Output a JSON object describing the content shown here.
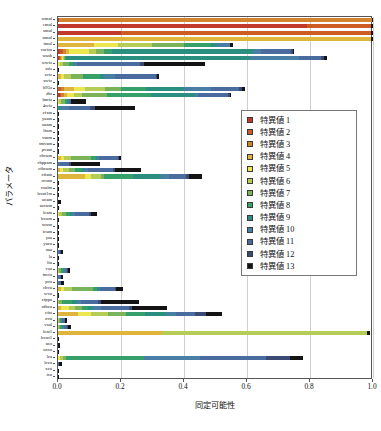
{
  "chart_data": {
    "type": "bar",
    "orientation": "horizontal",
    "stacked": true,
    "title": "",
    "xlabel": "同定可能性",
    "ylabel": "パラメータ",
    "xlim": [
      0.0,
      1.0
    ],
    "xticks": [
      "0.0",
      "0.2",
      "0.4",
      "0.6",
      "0.8",
      "1.0"
    ],
    "xtickvalues": [
      0.0,
      0.2,
      0.4,
      0.6,
      0.8,
      1.0
    ],
    "grid": "vertical",
    "legend_position": "center-right",
    "legend_title": "",
    "colors": [
      "#c0392b",
      "#cd5c23",
      "#d2842e",
      "#dfb53b",
      "#ece74f",
      "#b5cc55",
      "#7ab35a",
      "#35a06a",
      "#2a8f7f",
      "#4a7fa5",
      "#4a6b9e",
      "#3c4a73",
      "#141414"
    ],
    "series": [
      {
        "name": "特異値 1",
        "color": "#c0392b"
      },
      {
        "name": "特異値 2",
        "color": "#cd5c23"
      },
      {
        "name": "特異値 3",
        "color": "#d2842e"
      },
      {
        "name": "特異値 4",
        "color": "#dfb53b"
      },
      {
        "name": "特異値 5",
        "color": "#ece74f"
      },
      {
        "name": "特異値 6",
        "color": "#b5cc55"
      },
      {
        "name": "特異値 7",
        "color": "#7ab35a"
      },
      {
        "name": "特異値 8",
        "color": "#35a06a"
      },
      {
        "name": "特異値 9",
        "color": "#2a8f7f"
      },
      {
        "name": "特異値 10",
        "color": "#4a7fa5"
      },
      {
        "name": "特異値 11",
        "color": "#4a6b9e"
      },
      {
        "name": "特異値 12",
        "color": "#3c4a73"
      },
      {
        "name": "特異値 13",
        "color": "#141414"
      }
    ],
    "categories": [
      "wmul",
      "emul",
      "smul",
      "nmul",
      "imul",
      "variso",
      "wash",
      "wwfz",
      "stfz",
      "scfz",
      "swfz",
      "h95z",
      "dfz",
      "bmfz",
      "4wfz",
      "cfzm",
      "yaam",
      "oaam",
      "lfum",
      "vsum",
      "tmvam",
      "pvam",
      "chvum",
      "cbppam",
      "cfbcum",
      "cftam",
      "ovum",
      "vsulm",
      "lccut1m",
      "ucam",
      "uccum",
      "lcam",
      "lccum",
      "xcum",
      "icum",
      "yaa",
      "yacu",
      "oaa",
      "la",
      "lfu",
      "vsu",
      "tmva",
      "pva",
      "chvu",
      "wvu",
      "cfppa",
      "ofbcu",
      "cfta",
      "ovu",
      "vsul",
      "lcat1",
      "lccut1",
      "uca",
      "uccu",
      "lca",
      "lccu",
      "xcu",
      "icu"
    ],
    "rows": [
      {
        "label": "wmul",
        "segments": [
          0.002,
          0.0,
          0.996,
          0.0,
          0.0,
          0.0,
          0.0,
          0.0,
          0.0,
          0.0,
          0.0,
          0.0,
          0.002
        ]
      },
      {
        "label": "emul",
        "segments": [
          0.79,
          0.205,
          0.0,
          0.0,
          0.0,
          0.0,
          0.0,
          0.0,
          0.0,
          0.0,
          0.0,
          0.0,
          0.005
        ]
      },
      {
        "label": "smul",
        "segments": [
          0.2,
          0.795,
          0.0,
          0.0,
          0.0,
          0.0,
          0.0,
          0.0,
          0.0,
          0.0,
          0.0,
          0.0,
          0.005
        ]
      },
      {
        "label": "nmul",
        "segments": [
          0.0,
          0.0,
          0.0,
          0.995,
          0.0,
          0.0,
          0.0,
          0.0,
          0.0,
          0.0,
          0.0,
          0.0,
          0.005
        ]
      },
      {
        "label": "imul",
        "segments": [
          0.0,
          0.0,
          0.0,
          0.115,
          0.075,
          0.11,
          0.1,
          0.085,
          0.02,
          0.04,
          0.0,
          0.0,
          0.01
        ]
      },
      {
        "label": "variso",
        "segments": [
          0.005,
          0.01,
          0.01,
          0.01,
          0.065,
          0.02,
          0.025,
          0.025,
          0.45,
          0.025,
          0.095,
          0.005,
          0.005
        ]
      },
      {
        "label": "wash",
        "segments": [
          0.003,
          0.003,
          0.003,
          0.003,
          0.003,
          0.003,
          0.003,
          0.003,
          0.585,
          0.155,
          0.07,
          0.01,
          0.01
        ]
      },
      {
        "label": "wwfz",
        "segments": [
          0.0,
          0.0,
          0.0,
          0.0,
          0.005,
          0.01,
          0.02,
          0.012,
          0.005,
          0.01,
          0.2,
          0.01,
          0.195
        ]
      },
      {
        "label": "stfz",
        "segments": [
          0.0,
          0.0,
          0.0,
          0.0,
          0.0,
          0.0,
          0.0,
          0.0,
          0.0,
          0.0,
          0.0,
          0.0,
          0.004
        ]
      },
      {
        "label": "scfz",
        "segments": [
          0.0,
          0.0,
          0.0,
          0.01,
          0.01,
          0.02,
          0.04,
          0.055,
          0.01,
          0.035,
          0.13,
          0.005,
          0.005
        ]
      },
      {
        "label": "swfz",
        "segments": [
          0.0,
          0.0,
          0.0,
          0.0,
          0.0,
          0.0,
          0.0,
          0.0,
          0.0,
          0.0,
          0.0,
          0.0,
          0.004
        ]
      },
      {
        "label": "h95z",
        "segments": [
          0.0,
          0.01,
          0.01,
          0.03,
          0.035,
          0.065,
          0.05,
          0.08,
          0.12,
          0.085,
          0.09,
          0.01,
          0.01
        ]
      },
      {
        "label": "dfz",
        "segments": [
          0.005,
          0.005,
          0.01,
          0.01,
          0.02,
          0.025,
          0.08,
          0.14,
          0.14,
          0.01,
          0.095,
          0.005,
          0.005
        ]
      },
      {
        "label": "bmfz",
        "segments": [
          0.0,
          0.0,
          0.0,
          0.0,
          0.003,
          0.008,
          0.01,
          0.008,
          0.003,
          0.003,
          0.005,
          0.003,
          0.045
        ]
      },
      {
        "label": "4wfz",
        "segments": [
          0.0,
          0.0,
          0.0,
          0.0,
          0.0,
          0.0,
          0.0,
          0.003,
          0.003,
          0.03,
          0.065,
          0.015,
          0.13
        ]
      },
      {
        "label": "cfzm",
        "segments": [
          0.0,
          0.0,
          0.0,
          0.0,
          0.0,
          0.0,
          0.0,
          0.0,
          0.0,
          0.0,
          0.0,
          0.0,
          0.004
        ]
      },
      {
        "label": "yaam",
        "segments": [
          0.0,
          0.0,
          0.0,
          0.0,
          0.0,
          0.0,
          0.0,
          0.0,
          0.0,
          0.0,
          0.0,
          0.0,
          0.004
        ]
      },
      {
        "label": "oaam",
        "segments": [
          0.0,
          0.0,
          0.0,
          0.0,
          0.0,
          0.0,
          0.0,
          0.0,
          0.0,
          0.0,
          0.0,
          0.0,
          0.004
        ]
      },
      {
        "label": "lfum",
        "segments": [
          0.0,
          0.0,
          0.0,
          0.0,
          0.0,
          0.0,
          0.0,
          0.0,
          0.0,
          0.0,
          0.0,
          0.0,
          0.004
        ]
      },
      {
        "label": "vsum",
        "segments": [
          0.0,
          0.0,
          0.0,
          0.0,
          0.0,
          0.0,
          0.0,
          0.0,
          0.0,
          0.0,
          0.0,
          0.0,
          0.004
        ]
      },
      {
        "label": "tmvam",
        "segments": [
          0.0,
          0.0,
          0.0,
          0.0,
          0.0,
          0.0,
          0.0,
          0.0,
          0.0,
          0.0,
          0.0,
          0.0,
          0.004
        ]
      },
      {
        "label": "pvam",
        "segments": [
          0.0,
          0.0,
          0.0,
          0.0,
          0.0,
          0.0,
          0.0,
          0.0,
          0.0,
          0.0,
          0.0,
          0.0,
          0.004
        ]
      },
      {
        "label": "chvum",
        "segments": [
          0.0,
          0.0,
          0.0,
          0.008,
          0.012,
          0.02,
          0.065,
          0.015,
          0.005,
          0.005,
          0.06,
          0.005,
          0.005
        ]
      },
      {
        "label": "cbppam",
        "segments": [
          0.0,
          0.0,
          0.0,
          0.0,
          0.0,
          0.0,
          0.0,
          0.0,
          0.0,
          0.005,
          0.03,
          0.005,
          0.095
        ]
      },
      {
        "label": "cfbcum",
        "segments": [
          0.0,
          0.0,
          0.0,
          0.005,
          0.01,
          0.02,
          0.02,
          0.02,
          0.008,
          0.012,
          0.08,
          0.005,
          0.085
        ]
      },
      {
        "label": "cftam",
        "segments": [
          0.0,
          0.0,
          0.0,
          0.085,
          0.02,
          0.03,
          0.012,
          0.09,
          0.09,
          0.025,
          0.055,
          0.01,
          0.04
        ]
      },
      {
        "label": "ovum",
        "segments": [
          0.0,
          0.0,
          0.0,
          0.0,
          0.0,
          0.0,
          0.0,
          0.0,
          0.0,
          0.0,
          0.0,
          0.0,
          0.004
        ]
      },
      {
        "label": "vsulm",
        "segments": [
          0.0,
          0.0,
          0.0,
          0.0,
          0.0,
          0.0,
          0.0,
          0.0,
          0.0,
          0.0,
          0.0,
          0.0,
          0.004
        ]
      },
      {
        "label": "lccut1m",
        "segments": [
          0.0,
          0.0,
          0.0,
          0.0,
          0.0,
          0.0,
          0.0,
          0.0,
          0.0,
          0.0,
          0.0,
          0.0,
          0.004
        ]
      },
      {
        "label": "ucam",
        "segments": [
          0.0,
          0.0,
          0.0,
          0.0,
          0.0,
          0.0,
          0.0,
          0.0,
          0.0,
          0.0,
          0.0,
          0.0,
          0.008
        ]
      },
      {
        "label": "uccum",
        "segments": [
          0.0,
          0.0,
          0.0,
          0.0,
          0.0,
          0.0,
          0.0,
          0.0,
          0.0,
          0.0,
          0.0,
          0.0,
          0.004
        ]
      },
      {
        "label": "lcam",
        "segments": [
          0.0,
          0.0,
          0.0,
          0.0,
          0.003,
          0.01,
          0.012,
          0.012,
          0.008,
          0.01,
          0.045,
          0.005,
          0.02
        ]
      },
      {
        "label": "lccum",
        "segments": [
          0.0,
          0.0,
          0.0,
          0.0,
          0.0,
          0.0,
          0.0,
          0.0,
          0.0,
          0.0,
          0.0,
          0.0,
          0.004
        ]
      },
      {
        "label": "xcum",
        "segments": [
          0.0,
          0.0,
          0.0,
          0.0,
          0.0,
          0.0,
          0.0,
          0.0,
          0.0,
          0.0,
          0.0,
          0.0,
          0.004
        ]
      },
      {
        "label": "icum",
        "segments": [
          0.0,
          0.0,
          0.0,
          0.0,
          0.0,
          0.0,
          0.0,
          0.0,
          0.0,
          0.0,
          0.0,
          0.0,
          0.004
        ]
      },
      {
        "label": "yaa",
        "segments": [
          0.0,
          0.0,
          0.0,
          0.0,
          0.0,
          0.0,
          0.0,
          0.0,
          0.0,
          0.0,
          0.0,
          0.0,
          0.004
        ]
      },
      {
        "label": "yacu",
        "segments": [
          0.0,
          0.0,
          0.0,
          0.0,
          0.0,
          0.0,
          0.0,
          0.0,
          0.0,
          0.0,
          0.0,
          0.0,
          0.004
        ]
      },
      {
        "label": "oaa",
        "segments": [
          0.0,
          0.0,
          0.0,
          0.0,
          0.0,
          0.0,
          0.0,
          0.0,
          0.0,
          0.002,
          0.005,
          0.002,
          0.008
        ]
      },
      {
        "label": "la",
        "segments": [
          0.0,
          0.0,
          0.0,
          0.0,
          0.0,
          0.0,
          0.0,
          0.0,
          0.0,
          0.0,
          0.0,
          0.0,
          0.004
        ]
      },
      {
        "label": "lfu",
        "segments": [
          0.0,
          0.0,
          0.0,
          0.0,
          0.0,
          0.0,
          0.0,
          0.0,
          0.0,
          0.0,
          0.0,
          0.0,
          0.004
        ]
      },
      {
        "label": "vsu",
        "segments": [
          0.0,
          0.0,
          0.0,
          0.0,
          0.0,
          0.003,
          0.006,
          0.008,
          0.003,
          0.004,
          0.006,
          0.003,
          0.005
        ]
      },
      {
        "label": "tmva",
        "segments": [
          0.0,
          0.0,
          0.0,
          0.0,
          0.0,
          0.0,
          0.0,
          0.0,
          0.0,
          0.002,
          0.006,
          0.002,
          0.006
        ]
      },
      {
        "label": "pva",
        "segments": [
          0.0,
          0.0,
          0.0,
          0.0,
          0.0,
          0.0,
          0.0,
          0.0,
          0.0,
          0.002,
          0.006,
          0.002,
          0.01
        ]
      },
      {
        "label": "chvu",
        "segments": [
          0.0,
          0.0,
          0.0,
          0.008,
          0.012,
          0.025,
          0.065,
          0.015,
          0.005,
          0.005,
          0.045,
          0.005,
          0.02
        ]
      },
      {
        "label": "wvu",
        "segments": [
          0.0,
          0.0,
          0.0,
          0.0,
          0.0,
          0.0,
          0.0,
          0.0,
          0.0,
          0.0,
          0.0,
          0.0,
          0.004
        ]
      },
      {
        "label": "cfppa",
        "segments": [
          0.0,
          0.0,
          0.0,
          0.0,
          0.0,
          0.003,
          0.01,
          0.03,
          0.018,
          0.012,
          0.055,
          0.008,
          0.12
        ]
      },
      {
        "label": "ofbcu",
        "segments": [
          0.0,
          0.0,
          0.0,
          0.01,
          0.025,
          0.02,
          0.02,
          0.02,
          0.015,
          0.025,
          0.09,
          0.01,
          0.11
        ]
      },
      {
        "label": "cfta",
        "segments": [
          0.0,
          0.0,
          0.0,
          0.065,
          0.04,
          0.055,
          0.055,
          0.06,
          0.07,
          0.03,
          0.06,
          0.035,
          0.05
        ]
      },
      {
        "label": "ovu",
        "segments": [
          0.0,
          0.0,
          0.0,
          0.0,
          0.0,
          0.002,
          0.003,
          0.003,
          0.002,
          0.003,
          0.008,
          0.002,
          0.005
        ]
      },
      {
        "label": "vsul",
        "segments": [
          0.0,
          0.0,
          0.0,
          0.0,
          0.0,
          0.002,
          0.004,
          0.006,
          0.003,
          0.003,
          0.01,
          0.003,
          0.01
        ]
      },
      {
        "label": "lcat1",
        "segments": [
          0.0,
          0.0,
          0.0,
          0.33,
          0.0,
          0.65,
          0.0,
          0.0,
          0.0,
          0.0,
          0.0,
          0.0,
          0.012
        ]
      },
      {
        "label": "lccut1",
        "segments": [
          0.0,
          0.0,
          0.0,
          0.0,
          0.0,
          0.0,
          0.0,
          0.0,
          0.0,
          0.0,
          0.0,
          0.0,
          0.004
        ]
      },
      {
        "label": "uca",
        "segments": [
          0.0,
          0.0,
          0.0,
          0.0,
          0.0,
          0.0,
          0.0,
          0.0,
          0.0,
          0.0,
          0.0,
          0.0,
          0.005
        ]
      },
      {
        "label": "uccu",
        "segments": [
          0.0,
          0.0,
          0.0,
          0.0,
          0.0,
          0.0,
          0.0,
          0.0,
          0.0,
          0.0,
          0.0,
          0.0,
          0.004
        ]
      },
      {
        "label": "lca",
        "segments": [
          0.0,
          0.0,
          0.0,
          0.0,
          0.005,
          0.01,
          0.012,
          0.245,
          0.0,
          0.18,
          0.21,
          0.075,
          0.04
        ]
      },
      {
        "label": "lccu",
        "segments": [
          0.0,
          0.0,
          0.0,
          0.0,
          0.0,
          0.0,
          0.0,
          0.0,
          0.0,
          0.0,
          0.002,
          0.002,
          0.008
        ]
      },
      {
        "label": "xcu",
        "segments": [
          0.0,
          0.0,
          0.0,
          0.0,
          0.0,
          0.0,
          0.0,
          0.0,
          0.0,
          0.0,
          0.0,
          0.0,
          0.004
        ]
      },
      {
        "label": "icu",
        "segments": [
          0.0,
          0.0,
          0.0,
          0.0,
          0.0,
          0.0,
          0.0,
          0.0,
          0.0,
          0.0,
          0.0,
          0.0,
          0.004
        ]
      }
    ]
  }
}
